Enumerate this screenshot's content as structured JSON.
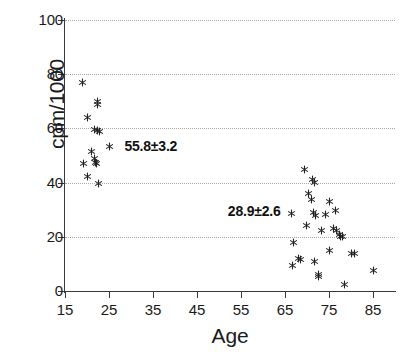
{
  "chart_data": {
    "type": "scatter",
    "title": "",
    "xlabel": "Age",
    "ylabel": "cpm/1000",
    "xlim": [
      15,
      90
    ],
    "ylim": [
      0,
      100
    ],
    "xticks": [
      15,
      25,
      35,
      45,
      55,
      65,
      75,
      85
    ],
    "yticks": [
      0,
      20,
      40,
      60,
      80,
      100
    ],
    "grid": "horizontal-dotted",
    "legend": "none",
    "marker": "asterisk",
    "marker_color": "#222222",
    "annotations": [
      {
        "text": "55.8±3.2",
        "x": 28.5,
        "y": 53.5
      },
      {
        "text": "28.9±2.6",
        "x": 52.0,
        "y": 29.5
      }
    ],
    "series": [
      {
        "name": "young",
        "mean_label": "55.8±3.2",
        "points": [
          [
            19.0,
            77.0
          ],
          [
            22.3,
            70.0
          ],
          [
            22.3,
            69.0
          ],
          [
            20.1,
            64.0
          ],
          [
            21.8,
            59.5
          ],
          [
            22.3,
            59.3
          ],
          [
            22.8,
            59.0
          ],
          [
            25.0,
            53.5
          ],
          [
            21.0,
            51.5
          ],
          [
            21.6,
            49.0
          ],
          [
            22.0,
            47.5
          ],
          [
            22.2,
            47.0
          ],
          [
            19.3,
            47.0
          ],
          [
            20.0,
            42.3
          ],
          [
            22.6,
            39.8
          ]
        ]
      },
      {
        "name": "elderly",
        "mean_label": "28.9±2.6",
        "points": [
          [
            69.4,
            45.0
          ],
          [
            71.3,
            41.2
          ],
          [
            71.6,
            40.0
          ],
          [
            70.4,
            35.8
          ],
          [
            71.0,
            33.8
          ],
          [
            75.0,
            33.2
          ],
          [
            66.5,
            28.5
          ],
          [
            71.5,
            28.8
          ],
          [
            72.0,
            28.0
          ],
          [
            74.3,
            28.3
          ],
          [
            76.5,
            29.7
          ],
          [
            69.8,
            24.3
          ],
          [
            73.2,
            22.5
          ],
          [
            76.0,
            23.0
          ],
          [
            76.6,
            22.3
          ],
          [
            77.3,
            21.0
          ],
          [
            77.6,
            20.2
          ],
          [
            78.0,
            20.0
          ],
          [
            67.0,
            17.8
          ],
          [
            75.0,
            15.0
          ],
          [
            68.0,
            12.0
          ],
          [
            68.5,
            11.5
          ],
          [
            71.8,
            11.0
          ],
          [
            80.0,
            14.0
          ],
          [
            80.8,
            14.0
          ],
          [
            66.8,
            9.5
          ],
          [
            72.5,
            6.0
          ],
          [
            72.6,
            5.2
          ],
          [
            85.0,
            7.5
          ],
          [
            78.5,
            2.5
          ]
        ]
      }
    ]
  },
  "axis": {
    "y_title": "cpm/1000",
    "x_title": "Age",
    "y_tick_labels": [
      "0",
      "20",
      "40",
      "60",
      "80",
      "100"
    ],
    "x_tick_labels": [
      "15",
      "25",
      "35",
      "45",
      "55",
      "65",
      "75",
      "85"
    ]
  }
}
